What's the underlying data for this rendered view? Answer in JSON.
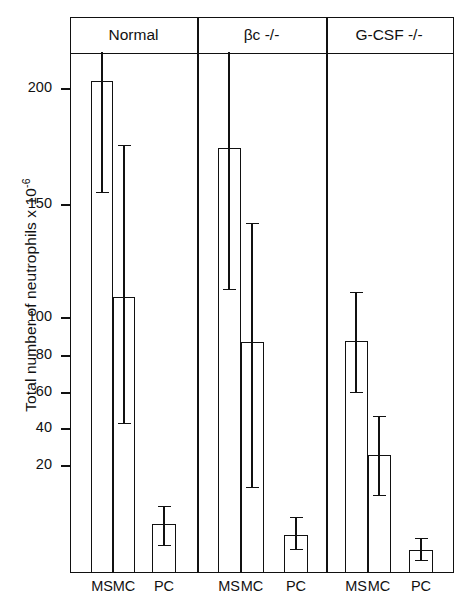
{
  "chart_data": {
    "type": "bar",
    "title": "",
    "xlabel": "",
    "ylabel": "Total number of neutrophils x 10-6",
    "ylabel_prefix": "Total number of neutrophils x 10",
    "ylabel_exponent": "-6",
    "ytick_labels": [
      "20",
      "40",
      "60",
      "80",
      "100",
      "150",
      "200"
    ],
    "ytick_values": [
      20,
      40,
      60,
      80,
      100,
      150,
      200
    ],
    "ytick_y_px": [
      465,
      428,
      392,
      355,
      317,
      204,
      88
    ],
    "axis_note": "non-linear y scale: compressed above 100",
    "grid": false,
    "legend": false,
    "panels": [
      {
        "label": "Normal",
        "categories": [
          "MS",
          "MC",
          "PC"
        ],
        "values": [
          203,
          115,
          19.5
        ],
        "err_low": [
          158,
          53,
          13
        ],
        "err_high": [
          233,
          175,
          26
        ],
        "err_high_clipped": [
          true,
          false,
          false
        ]
      },
      {
        "label": "βc -/-",
        "categories": [
          "MS",
          "MC",
          "PC"
        ],
        "values": [
          176,
          92,
          17
        ],
        "err_low": [
          114,
          35,
          12.5
        ],
        "err_high": [
          233,
          147,
          22
        ],
        "err_high_clipped": [
          true,
          false,
          false
        ]
      },
      {
        "label": "G-CSF -/-",
        "categories": [
          "MS",
          "MC",
          "PC"
        ],
        "values": [
          94,
          47,
          12.5
        ],
        "err_low": [
          74,
          31,
          9
        ],
        "err_high": [
          118,
          66,
          15
        ],
        "err_high_clipped": [
          false,
          false,
          false
        ]
      }
    ]
  },
  "axis": {
    "ticks": [
      {
        "label": "200",
        "y": 88
      },
      {
        "label": "150",
        "y": 204
      },
      {
        "label": "100",
        "y": 317
      },
      {
        "label": "80",
        "y": 355
      },
      {
        "label": "60",
        "y": 392
      },
      {
        "label": "40",
        "y": 428
      },
      {
        "label": "20",
        "y": 465
      }
    ]
  },
  "headers": [
    {
      "label": "Normal",
      "left": 70,
      "width": 127
    },
    {
      "label": "βc -/-",
      "left": 197,
      "width": 129
    },
    {
      "label": "G-CSF -/-",
      "left": 326,
      "width": 126
    }
  ],
  "bars": [
    {
      "name": "normal-ms",
      "left": 91,
      "width": 22,
      "top": 81,
      "center": 102,
      "err_top": 52,
      "err_bottom": 192,
      "cap_top": false,
      "cap_bottom": true
    },
    {
      "name": "normal-mc",
      "left": 113,
      "width": 22,
      "top": 297,
      "center": 124,
      "err_top": 145,
      "err_bottom": 423,
      "cap_top": true,
      "cap_bottom": true
    },
    {
      "name": "normal-pc",
      "left": 152,
      "width": 24,
      "top": 524,
      "center": 164,
      "err_top": 506,
      "err_bottom": 545,
      "cap_top": true,
      "cap_bottom": true
    },
    {
      "name": "bc-ms",
      "left": 218,
      "width": 23,
      "top": 148,
      "center": 229,
      "err_top": 52,
      "err_bottom": 289,
      "cap_top": false,
      "cap_bottom": true
    },
    {
      "name": "bc-mc",
      "left": 241,
      "width": 23,
      "top": 342,
      "center": 252,
      "err_top": 223,
      "err_bottom": 487,
      "cap_top": true,
      "cap_bottom": true
    },
    {
      "name": "bc-pc",
      "left": 284,
      "width": 24,
      "top": 535,
      "center": 296,
      "err_top": 517,
      "err_bottom": 549,
      "cap_top": true,
      "cap_bottom": true
    },
    {
      "name": "gcsf-ms",
      "left": 345,
      "width": 23,
      "top": 341,
      "center": 356,
      "err_top": 292,
      "err_bottom": 392,
      "cap_top": true,
      "cap_bottom": true
    },
    {
      "name": "gcsf-mc",
      "left": 368,
      "width": 23,
      "top": 455,
      "center": 379,
      "err_top": 416,
      "err_bottom": 495,
      "cap_top": true,
      "cap_bottom": true
    },
    {
      "name": "gcsf-pc",
      "left": 409,
      "width": 24,
      "top": 550,
      "center": 421,
      "err_top": 538,
      "err_bottom": 560,
      "cap_top": true,
      "cap_bottom": true
    }
  ],
  "xlabels": [
    {
      "text": "MS",
      "center": 102
    },
    {
      "text": "MC",
      "center": 124
    },
    {
      "text": "PC",
      "center": 164
    },
    {
      "text": "MS",
      "center": 229
    },
    {
      "text": "MC",
      "center": 252
    },
    {
      "text": "PC",
      "center": 296
    },
    {
      "text": "MS",
      "center": 356
    },
    {
      "text": "MC",
      "center": 379
    },
    {
      "text": "PC",
      "center": 421
    }
  ],
  "dividers": [
    197,
    326
  ],
  "colors": {
    "ink": "#111111",
    "background": "#ffffff"
  }
}
